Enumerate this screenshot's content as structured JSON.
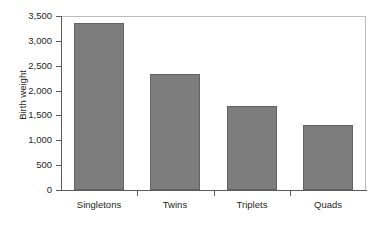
{
  "chart_data": {
    "type": "bar",
    "title": "",
    "xlabel": "",
    "ylabel": "Birth weight",
    "categories": [
      "Singletons",
      "Twins",
      "Triplets",
      "Quads"
    ],
    "values": [
      3350,
      2340,
      1680,
      1300
    ],
    "ylim": [
      0,
      3500
    ],
    "ytick_values": [
      0,
      500,
      1000,
      1500,
      2000,
      2500,
      3000,
      3500
    ],
    "ytick_labels": [
      "0",
      "500",
      "1,000",
      "1,500",
      "2,000",
      "2,500",
      "3,000",
      "3,500"
    ],
    "grid": false,
    "legend": null,
    "series": [
      {
        "name": "Birth weight",
        "values": [
          3350,
          2340,
          1680,
          1300
        ],
        "color": "#7d7d7d",
        "edge_color": "#636363"
      }
    ],
    "colors": {
      "bar_fill": "#7d7d7d",
      "bar_edge": "#636363",
      "axis_line": "#5a5a5a",
      "plot_border": "#bdbdbd",
      "text": "#231f20",
      "background": "#ffffff"
    }
  }
}
